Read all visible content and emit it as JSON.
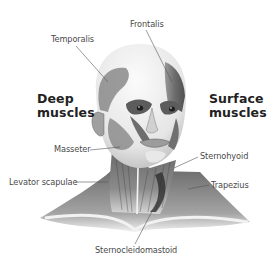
{
  "diagram": {
    "headings": {
      "left": {
        "line1": "Deep",
        "line2": "muscles"
      },
      "right": {
        "line1": "Surface",
        "line2": "muscles"
      }
    },
    "labels": {
      "frontalis": "Frontalis",
      "temporalis": "Temporalis",
      "masseter": "Masseter",
      "levator_scapulae": "Levator scapulae",
      "sternohyoid": "Sternohyoid",
      "trapezius": "Trapezius",
      "sternocleidomastoid": "Sternocleidomastoid"
    },
    "colors": {
      "background": "#ffffff",
      "label_text": "#4a4a4a",
      "heading_text": "#222222",
      "leader_line": "#555555",
      "skin_light": "#eeeeee",
      "muscle_dark": "#7a7a7a"
    }
  }
}
